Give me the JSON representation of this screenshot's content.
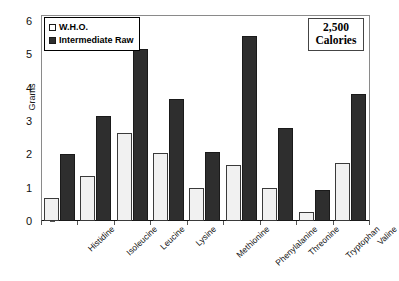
{
  "chart_data": {
    "type": "bar",
    "title": "",
    "xlabel": "",
    "ylabel": "Grams",
    "ylim": [
      0,
      6
    ],
    "ytick_labels": [
      "0",
      "1",
      "2",
      "3",
      "4",
      "5",
      "6"
    ],
    "yticks": [
      0,
      1,
      2,
      3,
      4,
      5,
      6
    ],
    "grid": false,
    "legend_position": "top-left",
    "categories": [
      "Histidine",
      "Isoleucine",
      "Leucine",
      "Lysine",
      "Methionine",
      "Phenylalanine",
      "Threonine",
      "Tryptophan",
      "Valine"
    ],
    "series": [
      {
        "name": "W.H.O.",
        "color": "#f1f1f1",
        "values": [
          0.68,
          1.35,
          2.64,
          2.03,
          1.0,
          1.68,
          1.0,
          0.26,
          1.75
        ]
      },
      {
        "name": "Intermediate Raw",
        "color": "#2e2e2e",
        "values": [
          2.0,
          3.15,
          5.15,
          3.67,
          2.08,
          5.55,
          2.8,
          0.92,
          3.8
        ]
      }
    ],
    "annotations": [
      {
        "name": "calorie-box",
        "lines": [
          "2,500",
          "Calories"
        ]
      }
    ]
  },
  "legend": {
    "items": [
      {
        "label": "W.H.O.",
        "swatch": "open-square-swatch"
      },
      {
        "label": "Intermediate Raw",
        "swatch": "filled-square-swatch"
      }
    ]
  },
  "calorie_box": {
    "amount": "2,500",
    "unit": "Calories"
  },
  "axes": {
    "y_title": "Grams"
  }
}
